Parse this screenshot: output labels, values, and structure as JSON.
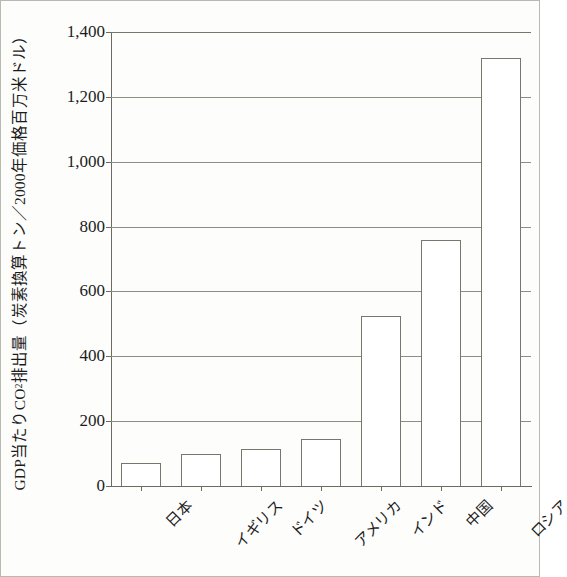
{
  "chart_data": {
    "type": "bar",
    "title": "",
    "subtitle": "",
    "xlabel": "",
    "ylabel_parts": {
      "pre": "GDP当たりCO",
      "sub": "2",
      "post": "排出量（炭素換算トン／2000年価格百万米ドル）"
    },
    "ylabel": "GDP当たりCO2排出量（炭素換算トン／2000年価格百万米ドル）",
    "categories": [
      "日本",
      "イギリス",
      "ドイツ",
      "アメリカ",
      "インド",
      "中国",
      "ロシア"
    ],
    "values": [
      70,
      98,
      115,
      145,
      525,
      760,
      1320
    ],
    "ylim": [
      0,
      1400
    ],
    "ytick_values": [
      0,
      200,
      400,
      600,
      800,
      1000,
      1200,
      1400
    ],
    "ytick_labels": [
      "0",
      "200",
      "400",
      "600",
      "800",
      "1,000",
      "1,200",
      "1,400"
    ],
    "grid": true,
    "grid_axis": "y",
    "legend": null,
    "legend_position": "none",
    "bar_fill_color": "#ffffff",
    "bar_edge_color": "#77776e",
    "grid_color": "#8d8d83",
    "axis_color": "#6b6b63",
    "text_color": "#1c1c1c",
    "background_color": "#fdfdfc"
  }
}
